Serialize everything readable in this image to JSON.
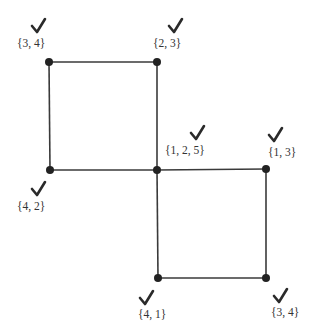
{
  "diagram": {
    "type": "graph",
    "nodes": [
      {
        "id": "tl",
        "x": 49,
        "y": 62,
        "label": "{3, 4}",
        "lx": 17,
        "ly": 47,
        "cx": 38,
        "cy": 25,
        "checked": true
      },
      {
        "id": "tr",
        "x": 157,
        "y": 62,
        "label": "{2, 3}",
        "lx": 153,
        "ly": 47,
        "cx": 175,
        "cy": 25,
        "checked": true
      },
      {
        "id": "ml",
        "x": 50,
        "y": 170,
        "label": "{4, 2}",
        "lx": 17,
        "ly": 210,
        "cx": 38,
        "cy": 188,
        "checked": true
      },
      {
        "id": "c",
        "x": 157,
        "y": 170,
        "label": "{1, 2, 5}",
        "lx": 165,
        "ly": 154,
        "cx": 197,
        "cy": 132,
        "checked": true
      },
      {
        "id": "r",
        "x": 266,
        "y": 169,
        "label": "{1, 3}",
        "lx": 268,
        "ly": 156,
        "cx": 275,
        "cy": 134,
        "checked": true
      },
      {
        "id": "bl",
        "x": 158,
        "y": 278,
        "label": "{4, 1}",
        "lx": 138,
        "ly": 318,
        "cx": 146,
        "cy": 297,
        "checked": true
      },
      {
        "id": "br",
        "x": 266,
        "y": 278,
        "label": "{3, 4}",
        "lx": 271,
        "ly": 316,
        "cx": 280,
        "cy": 295,
        "checked": true
      }
    ],
    "edges": [
      [
        "tl",
        "tr"
      ],
      [
        "tl",
        "ml"
      ],
      [
        "tr",
        "c"
      ],
      [
        "ml",
        "c"
      ],
      [
        "c",
        "r"
      ],
      [
        "c",
        "bl"
      ],
      [
        "r",
        "br"
      ],
      [
        "bl",
        "br"
      ]
    ],
    "colors": {
      "edge": "#3a3a3a",
      "node": "#222222",
      "check": "#2a2a2a",
      "label": "#333333"
    }
  }
}
